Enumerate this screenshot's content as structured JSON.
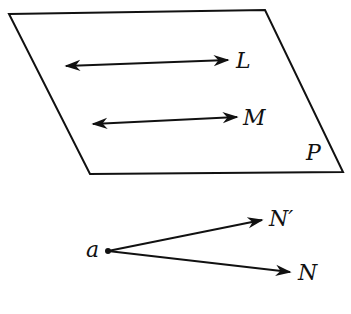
{
  "diagram": {
    "plane": {
      "label": "P",
      "vertices": [
        [
          9,
          14
        ],
        [
          265,
          10
        ],
        [
          343,
          172
        ],
        [
          90,
          174
        ]
      ]
    },
    "lines": [
      {
        "label": "L",
        "from": [
          66,
          66
        ],
        "to": [
          228,
          60
        ]
      },
      {
        "label": "M",
        "from": [
          93,
          124
        ],
        "to": [
          237,
          117
        ]
      }
    ],
    "point": {
      "label": "a",
      "at": [
        108,
        251
      ]
    },
    "rays": [
      {
        "label": "N′",
        "from": [
          108,
          251
        ],
        "to": [
          262,
          220
        ]
      },
      {
        "label": "N",
        "from": [
          108,
          251
        ],
        "to": [
          290,
          272
        ]
      }
    ],
    "stroke_color": "#111111"
  }
}
